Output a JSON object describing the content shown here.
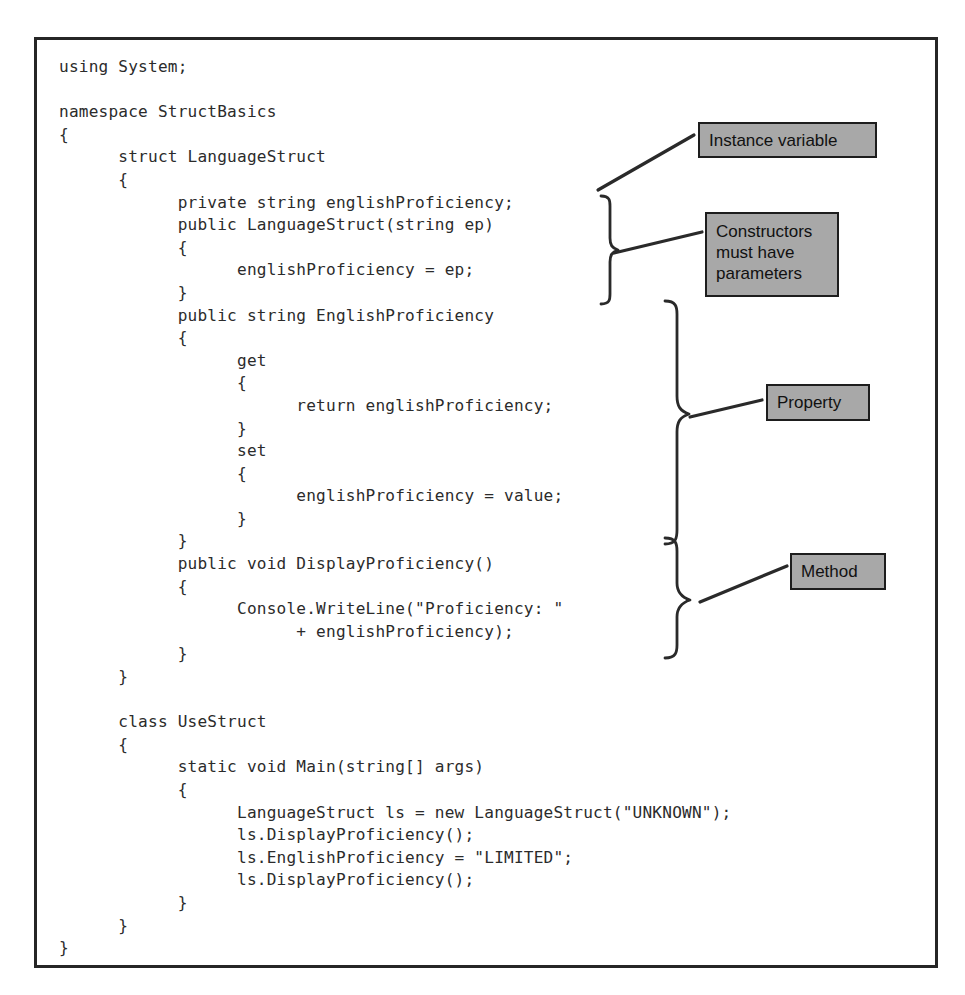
{
  "figure": {
    "kind": "code-listing-with-annotations",
    "language": "C#",
    "border_color": "#262626",
    "background_color": "#ffffff"
  },
  "code": {
    "text": "using System;\n\nnamespace StructBasics\n{\n      struct LanguageStruct\n      {\n            private string englishProficiency;\n            public LanguageStruct(string ep)\n            {\n                  englishProficiency = ep;\n            }\n            public string EnglishProficiency\n            {\n                  get\n                  {\n                        return englishProficiency;\n                  }\n                  set\n                  {\n                        englishProficiency = value;\n                  }\n            }\n            public void DisplayProficiency()\n            {\n                  Console.WriteLine(\"Proficiency: \"\n                        + englishProficiency);\n            }\n      }\n\n      class UseStruct\n      {\n            static void Main(string[] args)\n            {\n                  LanguageStruct ls = new LanguageStruct(\"UNKNOWN\");\n                  ls.DisplayProficiency();\n                  ls.EnglishProficiency = \"LIMITED\";\n                  ls.DisplayProficiency();\n            }\n      }\n}",
    "lines": [
      "using System;",
      "",
      "namespace StructBasics",
      "{",
      "      struct LanguageStruct",
      "      {",
      "            private string englishProficiency;",
      "            public LanguageStruct(string ep)",
      "            {",
      "                  englishProficiency = ep;",
      "            }",
      "            public string EnglishProficiency",
      "            {",
      "                  get",
      "                  {",
      "                        return englishProficiency;",
      "                  }",
      "                  set",
      "                  {",
      "                        englishProficiency = value;",
      "                  }",
      "            }",
      "            public void DisplayProficiency()",
      "            {",
      "                  Console.WriteLine(\"Proficiency: \"",
      "                        + englishProficiency);",
      "            }",
      "      }",
      "",
      "      class UseStruct",
      "      {",
      "            static void Main(string[] args)",
      "            {",
      "                  LanguageStruct ls = new LanguageStruct(\"UNKNOWN\");",
      "                  ls.DisplayProficiency();",
      "                  ls.EnglishProficiency = \"LIMITED\";",
      "                  ls.DisplayProficiency();",
      "            }",
      "      }",
      "}"
    ]
  },
  "annotations": {
    "box_fill": "#a8a8a8",
    "box_border": "#1d1d1d",
    "items": [
      {
        "id": "instance-variable",
        "label": "Instance variable"
      },
      {
        "id": "constructors",
        "label": "Constructors must have parameters",
        "line1": "Constructors",
        "line2": "must have",
        "line3": "parameters"
      },
      {
        "id": "property",
        "label": "Property"
      },
      {
        "id": "method",
        "label": "Method"
      }
    ]
  }
}
